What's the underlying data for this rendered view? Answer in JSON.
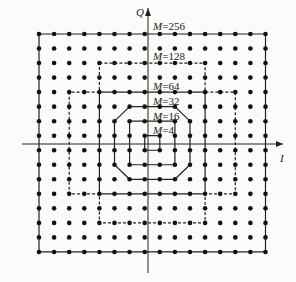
{
  "diagram": {
    "type": "QAM constellation diagram",
    "axes": {
      "x_label": "I",
      "y_label": "Q"
    },
    "grid": {
      "columns": 16,
      "rows": 16
    },
    "boundaries": [
      {
        "label": "M=256",
        "style": "solid"
      },
      {
        "label": "M=128",
        "style": "dashed"
      },
      {
        "label": "M=64",
        "style": "solid"
      },
      {
        "label": "M=32",
        "style": "solid"
      },
      {
        "label": "M=16",
        "style": "solid"
      },
      {
        "label": "M=4",
        "style": "solid"
      }
    ]
  },
  "labels": {
    "q": "Q",
    "i": "I",
    "m256": "=256",
    "m128": "=128",
    "m64": "=64",
    "m32": "=32",
    "m16": "=16",
    "m4": "=4",
    "m": "M"
  },
  "colors": {
    "ink": "#111111",
    "background": "#fbfbfa"
  }
}
